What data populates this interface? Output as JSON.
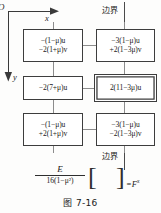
{
  "figure": {
    "caption": "图 7-16",
    "axes": {
      "origin_label": "O",
      "x_label": "x",
      "y_label": "y"
    },
    "boundary_labels": {
      "top": "边界",
      "bottom": "边界"
    },
    "cells": [
      {
        "id": "top-left",
        "double_border": false,
        "lines": [
          "−(1−μ)u",
          "−2(1+μ)v"
        ]
      },
      {
        "id": "top-right",
        "double_border": false,
        "lines": [
          "−3(1−μ)u",
          "+2(1−3μ)v"
        ]
      },
      {
        "id": "middle-left",
        "double_border": false,
        "lines": [
          "−2(7+μ)u"
        ]
      },
      {
        "id": "middle-right",
        "double_border": true,
        "lines": [
          "2(11−3μ)u"
        ]
      },
      {
        "id": "bottom-left",
        "double_border": false,
        "lines": [
          "−(1−μ)u",
          "+2(1+μ)v"
        ]
      },
      {
        "id": "bottom-right",
        "double_border": false,
        "lines": [
          "−3(1−μ)u",
          "−2(1−3μ)v"
        ]
      }
    ],
    "equation": {
      "numerator": "E",
      "denominator": "16(1−μ²)",
      "bracket_left": "[",
      "bracket_right": "]",
      "right_hand_side": "=F",
      "right_hand_subscript": "x"
    }
  }
}
